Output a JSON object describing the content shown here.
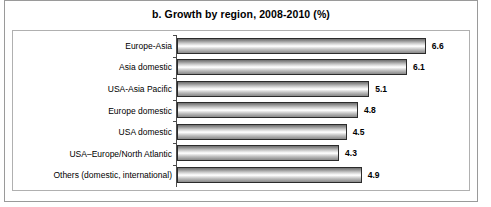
{
  "chart_data": {
    "type": "bar",
    "orientation": "horizontal",
    "title": "b. Growth by region, 2008-2010 (%)",
    "xlabel": "",
    "ylabel": "",
    "grid": false,
    "legend": null,
    "xlim": [
      0,
      7
    ],
    "categories": [
      "Europe-Asia",
      "Asia domestic",
      "USA-Asia Pacific",
      "Europe domestic",
      "USA domestic",
      "USA–Europe/North Atlantic",
      "Others (domestic, international)"
    ],
    "values": [
      6.6,
      6.1,
      5.1,
      4.8,
      4.5,
      4.3,
      4.9
    ],
    "value_labels": [
      "6.6",
      "6.1",
      "5.1",
      "4.8",
      "4.5",
      "4.3",
      "4.9"
    ],
    "bars": [
      {
        "category": "Europe-Asia",
        "value": 6.6,
        "label": "6.6"
      },
      {
        "category": "Asia domestic",
        "value": 6.1,
        "label": "6.1"
      },
      {
        "category": "USA-Asia Pacific",
        "value": 5.1,
        "label": "5.1"
      },
      {
        "category": "Europe domestic",
        "value": 4.8,
        "label": "4.8"
      },
      {
        "category": "USA domestic",
        "value": 4.5,
        "label": "4.5"
      },
      {
        "category": "USA–Europe/North Atlantic",
        "value": 4.3,
        "label": "4.3"
      },
      {
        "category": "Others (domestic, international)",
        "value": 4.9,
        "label": "4.9"
      }
    ],
    "colors": {
      "bar_outline": "#2b2b2b",
      "bar_fill_light": "#ffffff",
      "bar_fill_dark": "#6f6f6f",
      "axis": "#4a4a4a",
      "frame": "#b0b0b0",
      "outer_frame": "#9a9a9a",
      "text": "#000000",
      "background": "#ffffff"
    }
  }
}
